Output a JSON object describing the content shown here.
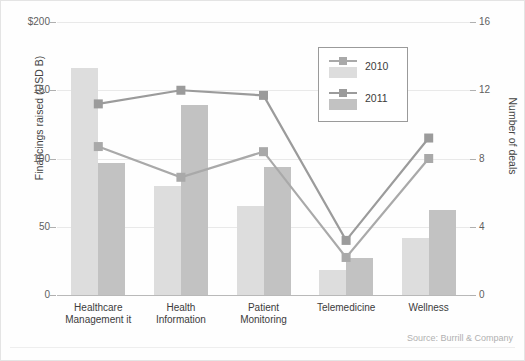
{
  "chart_data": {
    "type": "bar",
    "title": "",
    "categories": [
      "Healthcare Management it",
      "Health Information",
      "Patient Monitoring",
      "Telemedicine",
      "Wellness"
    ],
    "category_lines": [
      [
        "Healthcare",
        "Management it"
      ],
      [
        "Health",
        "Information"
      ],
      [
        "Patient",
        "Monitoring"
      ],
      [
        "Telemedicine",
        ""
      ],
      [
        "Wellness",
        ""
      ]
    ],
    "xlabel": "",
    "ylabel": "Financings raised (USD B)",
    "y2label": "Number of deals",
    "ylim": [
      0,
      200
    ],
    "y2lim": [
      0,
      16
    ],
    "yticks": [
      "$200",
      "150",
      "100",
      "50",
      "0"
    ],
    "ytick_values": [
      200,
      150,
      100,
      50,
      0
    ],
    "y2ticks": [
      "16",
      "12",
      "8",
      "4",
      "0"
    ],
    "y2tick_values": [
      16,
      12,
      8,
      4,
      0
    ],
    "grid": true,
    "legend_position": "upper-center",
    "series": [
      {
        "name": "2010",
        "kind": "bar",
        "axis": "left",
        "color": "#dddddd",
        "values": [
          166,
          80,
          65,
          18,
          42
        ]
      },
      {
        "name": "2011",
        "kind": "bar",
        "axis": "left",
        "color": "#c2c2c2",
        "values": [
          97,
          139,
          94,
          27,
          62
        ]
      },
      {
        "name": "2010",
        "kind": "line",
        "axis": "right",
        "color": "#a9a9a9",
        "values": [
          8.7,
          6.9,
          8.4,
          2.2,
          8.0
        ]
      },
      {
        "name": "2011",
        "kind": "line",
        "axis": "right",
        "color": "#9b9b9b",
        "values": [
          11.2,
          12.0,
          11.7,
          3.2,
          9.2
        ]
      }
    ],
    "legend": [
      {
        "label": "2010",
        "bar_color": "#dddddd",
        "line_color": "#a9a9a9"
      },
      {
        "label": "2011",
        "bar_color": "#c2c2c2",
        "line_color": "#9b9b9b"
      }
    ],
    "annotations": {
      "source": "Source: Burrill & Company"
    },
    "colors": {
      "bar_2010": "#dddddd",
      "bar_2011": "#c2c2c2",
      "line_2010": "#a9a9a9",
      "line_2011": "#9b9b9b",
      "grid": "#e9e9e9",
      "axis": "#b9b9b9",
      "text": "#3c3c3c",
      "background": "#fefefe"
    }
  }
}
